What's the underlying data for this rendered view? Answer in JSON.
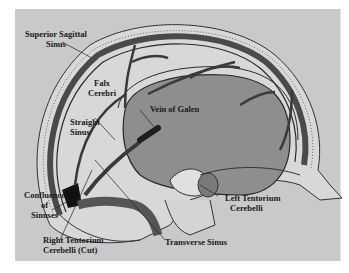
{
  "diagram": {
    "colors": {
      "background": "#c9c9c9",
      "skull": "#d6d6d6",
      "dura": "#4a4a4a",
      "brain_region": "#8f8f8f",
      "sinus_dark": "#1a1a1a",
      "vessel": "#3a3a3a"
    },
    "labels": {
      "superior_sagittal_sinus": {
        "line1": "Superior Sagittal",
        "line2": "Sinus"
      },
      "falx_cerebri": {
        "line1": "Falx",
        "line2": "Cerebri"
      },
      "straight_sinus": {
        "line1": "Straight",
        "line2": "Sinus"
      },
      "vein_of_galen": {
        "line1": "Vein of Galen"
      },
      "confluence_of_sinuses": {
        "line1": "Confluence",
        "line2": "of",
        "line3": "Sinuses"
      },
      "right_tentorium": {
        "line1": "Right Tentorium",
        "line2": "Cerebelli (Cut)"
      },
      "transverse_sinus": {
        "line1": "Transverse Sinus"
      },
      "left_tentorium": {
        "line1": "Left Tentorium",
        "line2": "Cerebelli"
      }
    }
  }
}
